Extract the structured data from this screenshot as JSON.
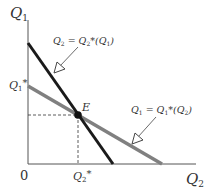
{
  "diagram": {
    "type": "reaction-functions",
    "axes": {
      "y_label": "Q",
      "y_label_sub": "1",
      "x_label": "Q",
      "x_label_sub": "2",
      "origin_label": "0"
    },
    "ticks": {
      "y_tick_label": "Q",
      "y_tick_sub": "1",
      "y_tick_star": "*",
      "x_tick_label": "Q",
      "x_tick_sub": "2",
      "x_tick_star": "*"
    },
    "equilibrium_label": "E",
    "curves": [
      {
        "name": "firm2-reaction",
        "label_parts": [
          "Q",
          "2",
          " = Q",
          "2",
          "*(Q",
          "1",
          ")"
        ],
        "color": "#1a1a1a"
      },
      {
        "name": "firm1-reaction",
        "label_parts": [
          "Q",
          "1",
          " = Q",
          "1",
          "*(Q",
          "2",
          ")"
        ],
        "color": "#808080"
      }
    ]
  }
}
